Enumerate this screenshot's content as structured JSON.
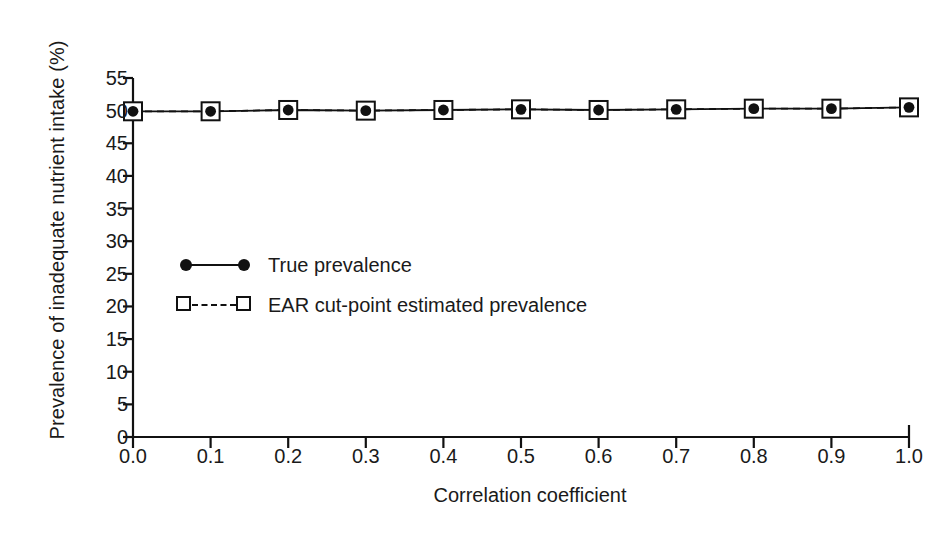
{
  "chart_data": {
    "type": "line",
    "title": "",
    "xlabel": "Correlation coefficient",
    "ylabel": "Prevalence of inadequate nutrient intake (%)",
    "x": [
      0.0,
      0.1,
      0.2,
      0.3,
      0.4,
      0.5,
      0.6,
      0.7,
      0.8,
      0.9,
      1.0
    ],
    "xlim": [
      0.0,
      1.0
    ],
    "ylim": [
      0,
      55
    ],
    "xticks": [
      "0.0",
      "0.1",
      "0.2",
      "0.3",
      "0.4",
      "0.5",
      "0.6",
      "0.7",
      "0.8",
      "0.9",
      "1.0"
    ],
    "yticks": [
      "0",
      "5",
      "10",
      "15",
      "20",
      "25",
      "30",
      "35",
      "40",
      "45",
      "50",
      "55"
    ],
    "ytick_values": [
      0,
      5,
      10,
      15,
      20,
      25,
      30,
      35,
      40,
      45,
      50,
      55
    ],
    "grid": false,
    "legend_position": "center-left",
    "series": [
      {
        "name": "True prevalence",
        "marker": "filled-circle",
        "linestyle": "solid",
        "color": "#111111",
        "values": [
          49.9,
          49.9,
          50.1,
          50.0,
          50.1,
          50.2,
          50.1,
          50.2,
          50.3,
          50.3,
          50.5
        ]
      },
      {
        "name": "EAR cut-point estimated prevalence",
        "marker": "open-square",
        "linestyle": "dashed",
        "color": "#111111",
        "values": [
          49.9,
          49.9,
          50.1,
          50.0,
          50.1,
          50.2,
          50.1,
          50.2,
          50.3,
          50.3,
          50.5
        ]
      }
    ]
  },
  "legend": {
    "items": [
      {
        "label": "True prevalence"
      },
      {
        "label": "EAR cut-point estimated prevalence"
      }
    ]
  },
  "axes": {
    "x_title": "Correlation coefficient",
    "y_title": "Prevalence of inadequate nutrient intake (%)"
  },
  "colors": {
    "ink": "#111111",
    "background": "#ffffff"
  }
}
